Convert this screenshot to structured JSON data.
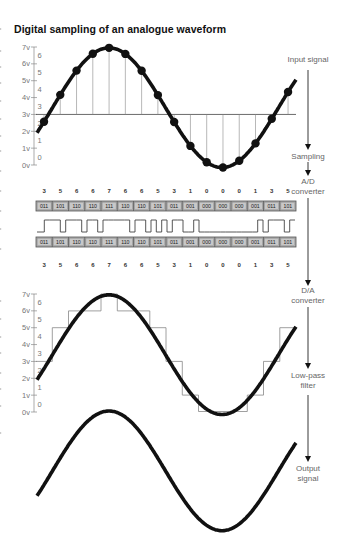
{
  "title": "Digital sampling of an analogue waveform",
  "stages": {
    "input": "Input signal",
    "sampling": "Sampling",
    "ad_line1": "A/D",
    "ad_line2": "converter",
    "da_line1": "D/A",
    "da_line2": "converter",
    "lowpass_line1": "Low-pass",
    "lowpass_line2": "filter",
    "output_line1": "Output",
    "output_line2": "signal"
  },
  "axis": {
    "voltage_labels": [
      "7v",
      "6v",
      "5v",
      "4v",
      "3v",
      "2v",
      "1v",
      "0v"
    ],
    "level_labels": [
      "6",
      "5",
      "4",
      "3",
      "2",
      "1",
      "0"
    ]
  },
  "samples": [
    3,
    5,
    6,
    6,
    7,
    6,
    6,
    5,
    3,
    1,
    0,
    0,
    0,
    1,
    3,
    5
  ],
  "binary_codes": [
    "011",
    "101",
    "110",
    "110",
    "111",
    "110",
    "110",
    "101",
    "011",
    "001",
    "000",
    "000",
    "000",
    "001",
    "011",
    "101"
  ],
  "colors": {
    "waveform": "#111111",
    "sample_lines": "#888888",
    "binary_box_fill": "#a9a9a9",
    "binary_box_border": "#555555",
    "label_text": "#666666"
  },
  "chart_data": [
    {
      "type": "line",
      "title": "Input signal with sampling points",
      "ylabel": "Voltage",
      "yticks": [
        "0v",
        "1v",
        "2v",
        "3v",
        "4v",
        "5v",
        "6v",
        "7v"
      ],
      "ylim": [
        0,
        7
      ],
      "baseline": 3,
      "x": [
        1,
        2,
        3,
        4,
        5,
        6,
        7,
        8,
        9,
        10,
        11,
        12,
        13,
        14,
        15,
        16
      ],
      "sample_values": [
        3,
        5,
        6,
        6,
        7,
        6,
        6,
        5,
        3,
        1,
        0,
        0,
        0,
        1,
        3,
        5
      ]
    },
    {
      "type": "table",
      "title": "A/D converter binary encoding",
      "decimal": [
        3,
        5,
        6,
        6,
        7,
        6,
        6,
        5,
        3,
        1,
        0,
        0,
        0,
        1,
        3,
        5
      ],
      "binary": [
        "011",
        "101",
        "110",
        "110",
        "111",
        "110",
        "110",
        "101",
        "011",
        "001",
        "000",
        "000",
        "000",
        "001",
        "011",
        "101"
      ]
    },
    {
      "type": "line",
      "title": "D/A converter staircase output with filtered sine",
      "yticks": [
        "0v",
        "1v",
        "2v",
        "3v",
        "4v",
        "5v",
        "6v",
        "7v"
      ],
      "ylim": [
        0,
        7
      ],
      "step_values": [
        3,
        5,
        6,
        6,
        7,
        6,
        6,
        5,
        3,
        1,
        0,
        0,
        0,
        1,
        3,
        5
      ]
    },
    {
      "type": "line",
      "title": "Output signal",
      "series": [
        {
          "name": "Output signal",
          "shape": "sine"
        }
      ]
    }
  ]
}
